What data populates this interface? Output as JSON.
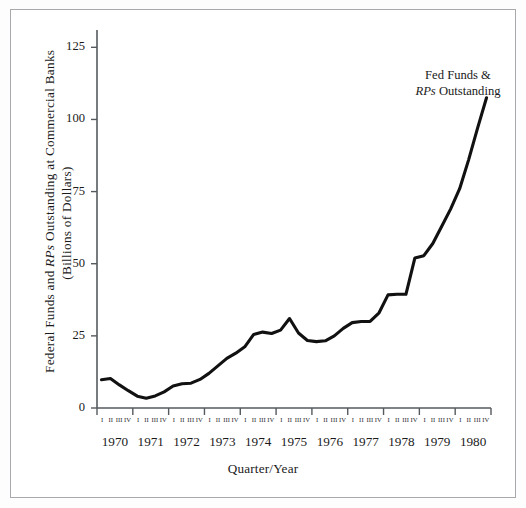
{
  "figure": {
    "background_color": "#ffffff",
    "frame_color": "#a9a9ad",
    "line_color": "#111111"
  },
  "annotation": {
    "line1": "Fed Funds &",
    "line2_italic": "RPs",
    "line2_rest": " Outstanding"
  },
  "axis": {
    "ylabel_part1": "Federal Funds and ",
    "ylabel_italic": "RPs",
    "ylabel_part2": " Outstanding at Commercial Banks",
    "ylabel_line2": "(Billions of Dollars)",
    "xtitle": "Quarter/Year",
    "ytick_labels": [
      "125",
      "100",
      "75",
      "50",
      "25",
      "0"
    ],
    "quarter_labels": [
      "I",
      "II",
      "III",
      "IV"
    ]
  },
  "chart_data": {
    "type": "line",
    "title": "",
    "subtitle": "",
    "xlabel": "Quarter/Year",
    "ylabel": "Federal Funds and RPs Outstanding at Commercial Banks (Billions of Dollars)",
    "ylim": [
      0,
      131
    ],
    "yticks": [
      0,
      25,
      50,
      75,
      100,
      125
    ],
    "grid": false,
    "legend": "none",
    "annotations": [
      {
        "text": "Fed Funds & RPs Outstanding",
        "x": "1980 I",
        "y": 118
      }
    ],
    "years": [
      1970,
      1971,
      1972,
      1973,
      1974,
      1975,
      1976,
      1977,
      1978,
      1979,
      1980
    ],
    "categories": [
      "1970 I",
      "1970 II",
      "1970 III",
      "1970 IV",
      "1971 I",
      "1971 II",
      "1971 III",
      "1971 IV",
      "1972 I",
      "1972 II",
      "1972 III",
      "1972 IV",
      "1973 I",
      "1973 II",
      "1973 III",
      "1973 IV",
      "1974 I",
      "1974 II",
      "1974 III",
      "1974 IV",
      "1975 I",
      "1975 II",
      "1975 III",
      "1975 IV",
      "1976 I",
      "1976 II",
      "1976 III",
      "1976 IV",
      "1977 I",
      "1977 II",
      "1977 III",
      "1977 IV",
      "1978 I",
      "1978 II",
      "1978 III",
      "1978 IV",
      "1979 I",
      "1979 II",
      "1979 III",
      "1979 IV",
      "1980 I",
      "1980 II",
      "1980 III",
      "1980 IV"
    ],
    "series": [
      {
        "name": "Fed Funds & RPs Outstanding",
        "values": [
          9.8,
          10.2,
          8.0,
          6.0,
          4.1,
          3.4,
          4.2,
          5.6,
          7.6,
          8.4,
          8.6,
          9.9,
          12.0,
          14.6,
          17.2,
          19.0,
          21.2,
          25.5,
          26.3,
          25.8,
          27.0,
          31.0,
          26.0,
          23.4,
          23.0,
          23.3,
          25.0,
          27.6,
          29.6,
          30.0,
          30.0,
          33.0,
          39.2,
          39.4,
          39.4,
          52.0,
          52.8,
          57.0,
          63.0,
          69.0,
          76.0,
          86.0,
          97.0,
          107.5
        ]
      }
    ]
  }
}
